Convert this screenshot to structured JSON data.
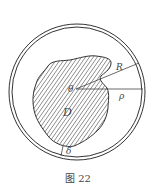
{
  "figure": {
    "caption": "图 22",
    "labels": {
      "center": "θ",
      "outer_radius": "R",
      "rho": "ρ",
      "region": "D",
      "gap": "δ"
    },
    "colors": {
      "stroke": "#333333",
      "hatch": "#444444",
      "background": "#ffffff"
    }
  }
}
